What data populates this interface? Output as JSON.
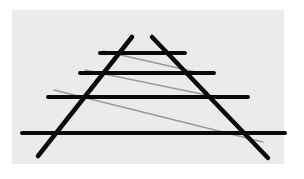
{
  "figure": {
    "name": "ponzo-illusion",
    "background": "#ffffff",
    "panel": {
      "x": 12,
      "y": 10,
      "width": 272,
      "height": 154,
      "color": "#ebebeb"
    },
    "colors": {
      "black_line": "#0a0a0a",
      "gray_line": "#9a9a9a"
    },
    "horizontal_lines": [
      {
        "x1": 100,
        "y1": 53,
        "x2": 185,
        "y2": 53,
        "width": 4
      },
      {
        "x1": 80,
        "y1": 73,
        "x2": 214,
        "y2": 73,
        "width": 4
      },
      {
        "x1": 48,
        "y1": 97,
        "x2": 248,
        "y2": 97,
        "width": 4
      },
      {
        "x1": 22,
        "y1": 133,
        "x2": 285,
        "y2": 133,
        "width": 4
      }
    ],
    "converging_lines": [
      {
        "x1": 132,
        "y1": 37,
        "x2": 38,
        "y2": 156,
        "width": 4.5
      },
      {
        "x1": 152,
        "y1": 37,
        "x2": 268,
        "y2": 158,
        "width": 4.5
      }
    ],
    "gray_lines": [
      {
        "x1": 103,
        "y1": 51,
        "x2": 200,
        "y2": 73,
        "width": 1.3
      },
      {
        "x1": 85,
        "y1": 70,
        "x2": 211,
        "y2": 96,
        "width": 1.3
      },
      {
        "x1": 54,
        "y1": 90,
        "x2": 263,
        "y2": 142,
        "width": 1.3
      }
    ]
  }
}
